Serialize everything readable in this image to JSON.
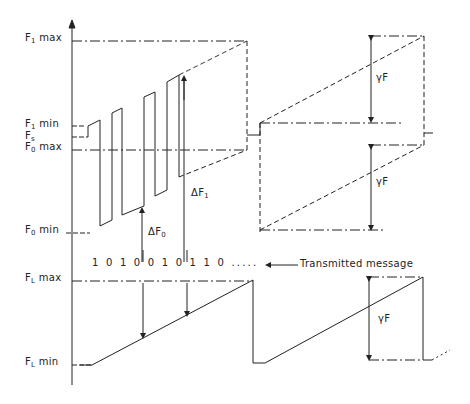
{
  "axis_labels": {
    "f1_max": {
      "main": "F",
      "sub": "1",
      "suffix": " max"
    },
    "f1_min": {
      "main": "F",
      "sub": "1",
      "suffix": " min"
    },
    "fs": {
      "main": "F",
      "sub": "s",
      "suffix": ""
    },
    "f0_max": {
      "main": "F",
      "sub": "0",
      "suffix": " max"
    },
    "f0_min": {
      "main": "F",
      "sub": "0",
      "suffix": " min"
    },
    "fl_max": {
      "main": "F",
      "sub": "L",
      "suffix": " max"
    },
    "fl_min": {
      "main": "F",
      "sub": "L",
      "suffix": " min"
    }
  },
  "annotations": {
    "delta_f0": "ΔF0",
    "delta_f0_main": "ΔF",
    "delta_f0_sub": "0",
    "delta_f1_main": "ΔF",
    "delta_f1_sub": "1",
    "gamma_f": "γF",
    "gamma_f_upper": "γF",
    "gamma_f_middle": "γF",
    "gamma_f_lower": "γF"
  },
  "message": {
    "bits": "1 0 1 0 0 1 0 1 1 0 .....",
    "arrow": "←",
    "label": "Transmitted message"
  },
  "colors": {
    "ink": "#222222",
    "background": "#ffffff"
  }
}
